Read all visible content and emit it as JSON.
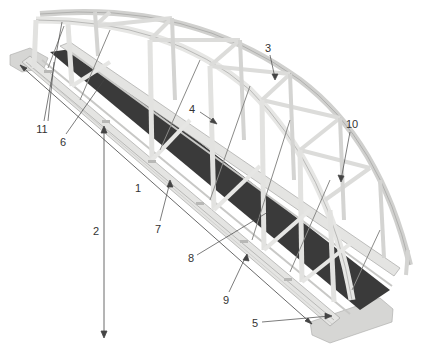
{
  "diagram": {
    "type": "bowstring-truss-footbridge-illustration",
    "colors": {
      "steel": "#e4e4e2",
      "steel_shade": "#c4c4c2",
      "steel_edge": "#9a9a98",
      "deck": "#3a3a3a",
      "abutment": "#d6d6d4",
      "leader": "#444444",
      "label": "#333333"
    },
    "callouts": [
      {
        "id": "1",
        "label": "1",
        "x": 138,
        "y": 188
      },
      {
        "id": "2",
        "label": "2",
        "x": 96,
        "y": 231
      },
      {
        "id": "3",
        "label": "3",
        "x": 268,
        "y": 48
      },
      {
        "id": "4",
        "label": "4",
        "x": 192,
        "y": 109
      },
      {
        "id": "5",
        "label": "5",
        "x": 255,
        "y": 323
      },
      {
        "id": "6",
        "label": "6",
        "x": 63,
        "y": 142
      },
      {
        "id": "7",
        "label": "7",
        "x": 158,
        "y": 229
      },
      {
        "id": "8",
        "label": "8",
        "x": 191,
        "y": 258
      },
      {
        "id": "9",
        "label": "9",
        "x": 226,
        "y": 300
      },
      {
        "id": "10",
        "label": "10",
        "x": 352,
        "y": 124
      },
      {
        "id": "11",
        "label": "11",
        "x": 42,
        "y": 129
      }
    ]
  }
}
